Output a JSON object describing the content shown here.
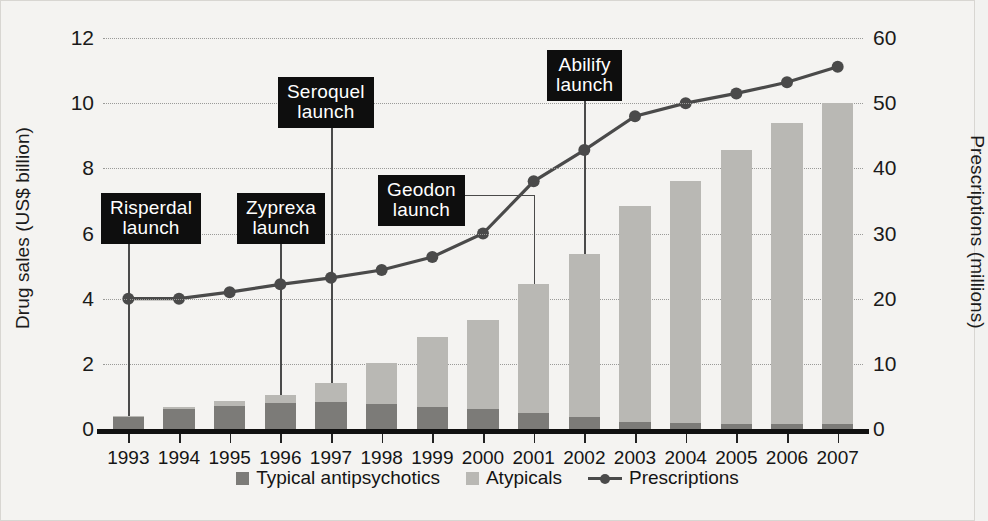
{
  "figure": {
    "background": "#f4f3f1",
    "bar_typical_color": "#7c7b78",
    "bar_atypical_color": "#b9b8b4",
    "line_color": "#4a4a4a",
    "callout_bg": "#0e0e0e",
    "callout_fg": "#ffffff"
  },
  "chart_data": {
    "type": "bar",
    "title": "",
    "categories": [
      "1993",
      "1994",
      "1995",
      "1996",
      "1997",
      "1998",
      "1999",
      "2000",
      "2001",
      "2002",
      "2003",
      "2004",
      "2005",
      "2006",
      "2007"
    ],
    "xlabel": "",
    "ylabel": "Drug sales (US$ billion)",
    "ylabel_right": "Prescriptions (millions)",
    "ylim": [
      0,
      12
    ],
    "ylim_right": [
      0,
      60
    ],
    "yticks": [
      0,
      2,
      4,
      6,
      8,
      10,
      12
    ],
    "yticks_right": [
      0,
      10,
      20,
      30,
      40,
      50,
      60
    ],
    "grid": true,
    "legend_position": "bottom",
    "series": [
      {
        "name": "Typical antipsychotics",
        "type": "bar",
        "stack": "sales",
        "color": "#7c7b78",
        "values": [
          0.38,
          0.6,
          0.72,
          0.8,
          0.82,
          0.76,
          0.68,
          0.6,
          0.5,
          0.36,
          0.22,
          0.18,
          0.16,
          0.16,
          0.16
        ]
      },
      {
        "name": "Atypicals",
        "type": "bar",
        "stack": "sales",
        "color": "#b9b8b4",
        "values": [
          0.02,
          0.08,
          0.13,
          0.25,
          0.58,
          1.26,
          2.14,
          2.76,
          3.94,
          5.0,
          6.62,
          7.42,
          8.4,
          9.24,
          9.84
        ]
      },
      {
        "name": "Prescriptions",
        "type": "line",
        "axis": "right",
        "color": "#4a4a4a",
        "unit": "millions",
        "values": [
          20.0,
          20.0,
          21.0,
          22.2,
          23.2,
          24.4,
          26.4,
          30.0,
          38.0,
          42.8,
          48.0,
          50.0,
          51.5,
          53.2,
          55.6
        ]
      }
    ],
    "bar_totals": [
      0.4,
      0.68,
      0.85,
      1.05,
      1.4,
      2.02,
      2.82,
      3.36,
      4.44,
      5.36,
      6.84,
      7.6,
      8.56,
      9.4,
      10.0
    ],
    "annotations": [
      {
        "label": "Risperdal\nlaunch",
        "year": "1993",
        "box_x": 100,
        "box_y": 192
      },
      {
        "label": "Zyprexa\nlaunch",
        "year": "1996",
        "box_x": 236,
        "box_y": 192
      },
      {
        "label": "Seroquel\nlaunch",
        "year": "1997",
        "box_x": 277,
        "box_y": 76
      },
      {
        "label": "Geodon\nlaunch",
        "year": "2001",
        "box_x": 377,
        "box_y": 174
      },
      {
        "label": "Abilify\nlaunch",
        "year": "2002",
        "box_x": 546,
        "box_y": 49
      }
    ]
  },
  "legend": {
    "items": [
      {
        "label": "Typical antipsychotics",
        "marker": "square-dark"
      },
      {
        "label": "Atypicals",
        "marker": "square-light"
      },
      {
        "label": "Prescriptions",
        "marker": "line-dot"
      }
    ]
  }
}
